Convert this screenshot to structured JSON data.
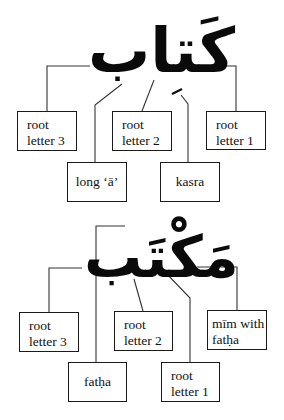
{
  "diagrams": [
    {
      "word": "كَتاب",
      "labels": {
        "root3": [
          "root",
          "letter 3"
        ],
        "root2": [
          "root",
          "letter 2"
        ],
        "root1": [
          "root",
          "letter 1"
        ],
        "long_a": "long ‘ā’",
        "kasra": "kasra"
      },
      "kasra_mark": "ِ"
    },
    {
      "word": "مَكْتَب",
      "labels": {
        "root3": [
          "root",
          "letter 3"
        ],
        "root2": [
          "root",
          "letter 2"
        ],
        "mim": [
          "mīm with",
          "fatḥa"
        ],
        "fatha": "fatḥa",
        "root1": [
          "root",
          "letter 1"
        ]
      }
    }
  ]
}
